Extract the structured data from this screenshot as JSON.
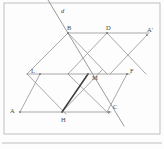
{
  "figure": {
    "kind": "geometry-diagram",
    "width": 164,
    "height": 149,
    "background_color": "#fdfdfd",
    "line_color": "#9a9a9a",
    "bold_segment_color": "#3b3b3b",
    "label_color": "#4a4a4a",
    "frame_color": "#b9b9b9"
  },
  "points": [
    {
      "id": "d",
      "label": "d",
      "x": 61,
      "y": 8,
      "type": "line-label"
    },
    {
      "id": "B",
      "label": "B",
      "x": 67,
      "y": 25,
      "type": "vertex"
    },
    {
      "id": "D",
      "label": "D",
      "x": 106,
      "y": 25,
      "type": "vertex"
    },
    {
      "id": "Ap",
      "label": "A'",
      "x": 147,
      "y": 27,
      "type": "vertex"
    },
    {
      "id": "L",
      "label": "L",
      "x": 31,
      "y": 68,
      "type": "vertex"
    },
    {
      "id": "M",
      "label": "M",
      "x": 92,
      "y": 75,
      "type": "vertex"
    },
    {
      "id": "F",
      "label": "F",
      "x": 130,
      "y": 68,
      "type": "vertex"
    },
    {
      "id": "A",
      "label": "A",
      "x": 10,
      "y": 108,
      "type": "vertex"
    },
    {
      "id": "H",
      "label": "H",
      "x": 61,
      "y": 117,
      "type": "vertex"
    },
    {
      "id": "C",
      "label": "C",
      "x": 113,
      "y": 104,
      "type": "vertex"
    }
  ],
  "geometry": {
    "vertices": {
      "B": {
        "x": 68,
        "y": 33
      },
      "D": {
        "x": 107,
        "y": 33
      },
      "Ap": {
        "x": 147,
        "y": 35
      },
      "L": {
        "x": 40,
        "y": 74
      },
      "M": {
        "x": 88,
        "y": 74
      },
      "F": {
        "x": 127,
        "y": 74
      },
      "A": {
        "x": 20,
        "y": 112
      },
      "H": {
        "x": 62,
        "y": 112
      },
      "C": {
        "x": 109,
        "y": 112
      },
      "Lx": {
        "x": 27,
        "y": 74
      },
      "Tl": {
        "x": 48,
        "y": 0
      }
    },
    "horizontal_rails": [
      {
        "name": "rail-top",
        "x1": 68,
        "y1": 33,
        "x2": 149,
        "y2": 33
      },
      {
        "name": "rail-middle",
        "x1": 27,
        "y1": 74,
        "x2": 130,
        "y2": 74
      },
      {
        "name": "rail-bottom",
        "x1": 20,
        "y1": 112,
        "x2": 111,
        "y2": 112
      }
    ],
    "lattice_edges": [
      {
        "name": "edge-B-L",
        "x1": 68,
        "y1": 33,
        "x2": 27,
        "y2": 74
      },
      {
        "name": "edge-B-M",
        "x1": 68,
        "y1": 33,
        "x2": 107,
        "y2": 74
      },
      {
        "name": "edge-D-M",
        "x1": 107,
        "y1": 33,
        "x2": 68,
        "y2": 74
      },
      {
        "name": "edge-D-F",
        "x1": 107,
        "y1": 33,
        "x2": 146,
        "y2": 74
      },
      {
        "name": "edge-Ap-F",
        "x1": 147,
        "y1": 35,
        "x2": 110,
        "y2": 74
      },
      {
        "name": "edge-L-A",
        "x1": 40,
        "y1": 74,
        "x2": 20,
        "y2": 112
      },
      {
        "name": "edge-L-H",
        "x1": 27,
        "y1": 74,
        "x2": 66,
        "y2": 114
      },
      {
        "name": "edge-M-C",
        "x1": 68,
        "y1": 74,
        "x2": 109,
        "y2": 114
      },
      {
        "name": "edge-F-C",
        "x1": 127,
        "y1": 74,
        "x2": 107,
        "y2": 112
      },
      {
        "name": "edge-H-up",
        "x1": 62,
        "y1": 112,
        "x2": 102,
        "y2": 70
      }
    ],
    "bold_edges": [
      {
        "name": "edge-M-H",
        "x1": 88,
        "y1": 74,
        "x2": 62,
        "y2": 112
      }
    ],
    "transversal": {
      "name": "line-d",
      "x1": 48,
      "y1": 0,
      "x2": 124,
      "y2": 126
    }
  },
  "frame": {
    "outer": {
      "x": 4,
      "y": 3,
      "width": 156,
      "height": 131
    },
    "baseline": {
      "x1": 2,
      "y1": 143,
      "x2": 162,
      "y2": 143
    }
  }
}
